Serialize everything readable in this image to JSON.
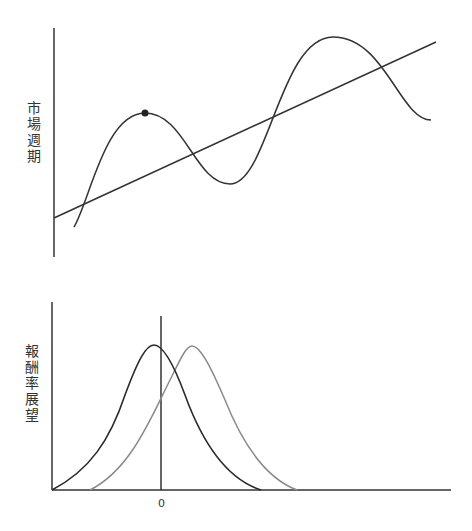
{
  "top_panel": {
    "ylabel": "市場週期",
    "description": "Market cycle oscillating around a rising trend line, with a marked peak",
    "marked_point": {
      "x": 145,
      "y": 113
    }
  },
  "bottom_panel": {
    "ylabel": "報酬率展望",
    "xtick_zero": "0",
    "description": "Two bell-shaped return expectation distributions; the gray one is shifted right of zero"
  },
  "colors": {
    "axis": "#333333",
    "cycle_curve": "#333333",
    "trend_line": "#333333",
    "dist_dark": "#2a2a2a",
    "dist_gray": "#8a8a8a"
  }
}
